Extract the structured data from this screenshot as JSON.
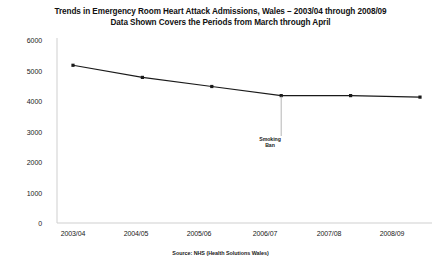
{
  "chart_data": {
    "type": "line",
    "title": "Trends in Emergency Room Heart Attack Admissions, Wales – 2003/04 through 2008/09",
    "subtitle": "Data Shown Covers the Periods from March through April",
    "categories": [
      "2003/04",
      "2004/05",
      "2005/06",
      "2006/07",
      "2007/08",
      "2008/09"
    ],
    "values": [
      5200,
      4800,
      4500,
      4200,
      4200,
      4150
    ],
    "series": [
      {
        "name": "Heart Attack Admissions",
        "values": [
          5200,
          4800,
          4500,
          4200,
          4200,
          4150
        ]
      }
    ],
    "xlabel": "",
    "ylabel": "",
    "ylim": [
      0,
      6000
    ],
    "yticks": [
      6000,
      5000,
      4000,
      3000,
      2000,
      1000,
      0
    ],
    "ytick_labels": [
      "6000",
      "5000",
      "4000",
      "3000",
      "2000",
      "1000",
      "0"
    ],
    "grid": false,
    "legend": false,
    "legend_position": "none",
    "line_color": "#1a1a1a",
    "marker_color": "#1a1a1a",
    "axis_color": "#c9c9c9",
    "background_color": "#ffffff",
    "annotations": [
      {
        "label_line1": "Smoking",
        "label_line2": "Ban",
        "at_category": "2006/07",
        "at_value": 4200
      }
    ],
    "source": "Source: NHS (Health Solutions Wales)"
  }
}
